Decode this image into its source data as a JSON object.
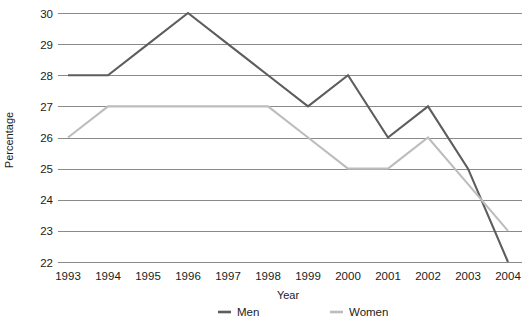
{
  "chart_data": {
    "type": "line",
    "title": "",
    "xlabel": "Year",
    "ylabel": "Percentage",
    "categories": [
      "1993",
      "1994",
      "1995",
      "1996",
      "1997",
      "1998",
      "1999",
      "2000",
      "2001",
      "2002",
      "2003",
      "2004"
    ],
    "x": [
      1993,
      1994,
      1995,
      1996,
      1997,
      1998,
      1999,
      2000,
      2001,
      2002,
      2003,
      2004
    ],
    "series": [
      {
        "name": "Men",
        "color": "#5d5d5d",
        "values": [
          28,
          28,
          29,
          30,
          29,
          28,
          27,
          28,
          26,
          27,
          25,
          22
        ]
      },
      {
        "name": "Women",
        "color": "#bdbdbd",
        "values": [
          26,
          27,
          27,
          27,
          27,
          27,
          26,
          25,
          25,
          26,
          24.5,
          23
        ]
      }
    ],
    "ylim": [
      22,
      30
    ],
    "yticks": [
      22,
      23,
      24,
      25,
      26,
      27,
      28,
      29,
      30
    ],
    "ytick_labels": [
      "22",
      "23",
      "24",
      "25",
      "26",
      "27",
      "28",
      "29",
      "30"
    ],
    "xlim": [
      1993,
      2004
    ],
    "grid": "horizontal",
    "gridline_color": "#8a8a8a",
    "legend_position": "bottom-center",
    "legend": [
      {
        "label": "Men",
        "color": "#5d5d5d"
      },
      {
        "label": "Women",
        "color": "#bdbdbd"
      }
    ]
  },
  "footnote": {
    "text": ""
  }
}
